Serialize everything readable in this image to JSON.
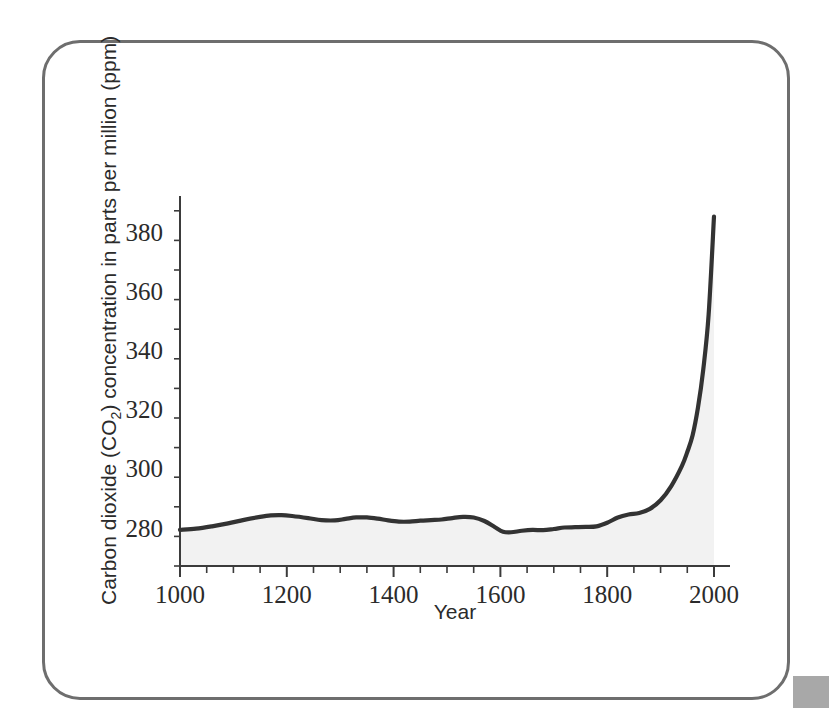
{
  "figure": {
    "frame_color": "#6e6e6e",
    "background_color": "#ffffff"
  },
  "chart_data": {
    "type": "line",
    "title": "",
    "subtitle": "",
    "xlabel": "Year",
    "ylabel": "Carbon dioxide (CO₂) concentration in parts per million (ppm)",
    "ylabel_parts": {
      "before": "Carbon dioxide (CO",
      "subscript": "2",
      "after": ") concentration in parts per million (ppm)"
    },
    "xlim": [
      1000,
      2030
    ],
    "ylim": [
      267,
      392
    ],
    "xticks": [
      1000,
      1200,
      1400,
      1600,
      1800,
      2000
    ],
    "xtick_labels": [
      "1000",
      "1200",
      "1400",
      "1600",
      "1800",
      "2000"
    ],
    "xminor_step": 50,
    "yticks": [
      280,
      300,
      320,
      340,
      360,
      380
    ],
    "ytick_labels": [
      "280",
      "300",
      "320",
      "340",
      "360",
      "380"
    ],
    "yminor_step": 10,
    "grid": false,
    "legend": null,
    "line_color": "#333333",
    "fill_color": "#f2f2f2",
    "series": [
      {
        "name": "Atmospheric CO2 concentration",
        "x": [
          1000,
          1030,
          1060,
          1090,
          1120,
          1150,
          1170,
          1190,
          1210,
          1240,
          1265,
          1290,
          1310,
          1330,
          1350,
          1370,
          1390,
          1410,
          1430,
          1450,
          1470,
          1490,
          1510,
          1530,
          1550,
          1570,
          1590,
          1605,
          1620,
          1640,
          1660,
          1680,
          1700,
          1720,
          1740,
          1760,
          1780,
          1800,
          1820,
          1840,
          1860,
          1880,
          1900,
          1920,
          1940,
          1950,
          1960,
          1970,
          1980,
          1990,
          2000
        ],
        "y": [
          279.2,
          279.6,
          280.4,
          281.4,
          282.6,
          283.6,
          284.1,
          284.2,
          283.9,
          283.2,
          282.5,
          282.4,
          282.9,
          283.4,
          283.4,
          283.0,
          282.4,
          282.0,
          282.0,
          282.3,
          282.5,
          282.7,
          283.2,
          283.6,
          283.4,
          282.2,
          280.1,
          278.6,
          278.4,
          278.9,
          279.2,
          279.1,
          279.5,
          280.0,
          280.1,
          280.2,
          280.4,
          281.6,
          283.4,
          284.4,
          284.9,
          286.3,
          289.2,
          294.0,
          300.8,
          305.5,
          311.2,
          320.5,
          333.5,
          352.0,
          385.0
        ],
        "units": "ppm"
      }
    ]
  }
}
